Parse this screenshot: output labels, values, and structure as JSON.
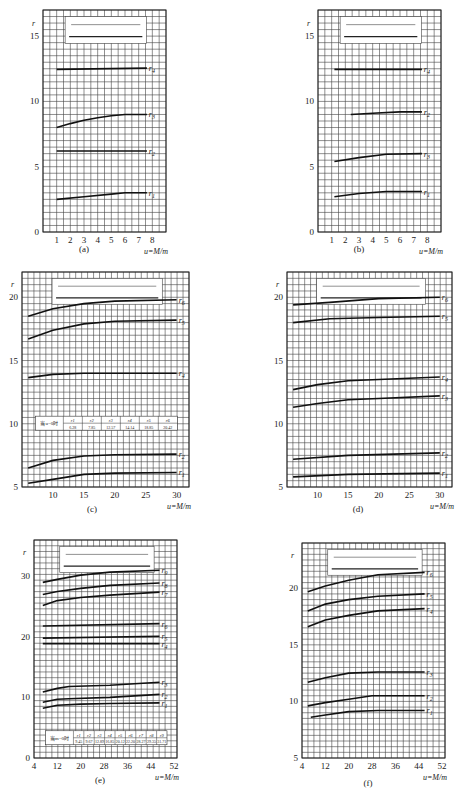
{
  "figure": {
    "y_axis_symbol": "r",
    "x_axis_label": "u = M/m",
    "panels": [
      {
        "id": "a",
        "caption": "(a)",
        "inset": "simple span l, mass m at l/2"
      },
      {
        "id": "b",
        "caption": "(b)",
        "inset": "simple span l, mass m at l/4"
      },
      {
        "id": "c",
        "caption": "(c)",
        "inset": "two spans l, masses m at l/2",
        "table_label": "当u=0时",
        "table": [
          {
            "k": "r1",
            "v": "6.28"
          },
          {
            "k": "r2",
            "v": "7.85"
          },
          {
            "k": "r3",
            "v": "12.57"
          },
          {
            "k": "r4",
            "v": "14.14"
          },
          {
            "k": "r5",
            "v": "18.85"
          },
          {
            "k": "r6",
            "v": "20.42"
          }
        ]
      },
      {
        "id": "d",
        "caption": "(d)",
        "inset": "two spans l, masses m at l/4"
      },
      {
        "id": "e",
        "caption": "(e)",
        "inset": "three spans l, masses m at l/2",
        "table_label": "当m=0时",
        "table": [
          {
            "k": "r1",
            "v": "9.45"
          },
          {
            "k": "r2",
            "v": "9.67"
          },
          {
            "k": "r3",
            "v": "12.89"
          },
          {
            "k": "r4",
            "v": "16.85"
          },
          {
            "k": "r5",
            "v": "20.12"
          },
          {
            "k": "r6",
            "v": "22.20"
          },
          {
            "k": "r7",
            "v": "28.27"
          },
          {
            "k": "r8",
            "v": "29.35"
          },
          {
            "k": "r9",
            "v": "31.71"
          }
        ]
      },
      {
        "id": "f",
        "caption": "(f)",
        "inset": "three spans l, masses m at l/4"
      }
    ]
  },
  "chart_data": [
    {
      "id": "a",
      "type": "line",
      "title": "(a)",
      "xlabel": "u=M/m",
      "ylabel": "r",
      "xlim": [
        0,
        9
      ],
      "ylim": [
        0,
        17
      ],
      "xticks": [
        1,
        2,
        3,
        4,
        5,
        6,
        7,
        8
      ],
      "yticks": [
        0,
        5,
        10,
        15
      ],
      "grid": true,
      "series": [
        {
          "name": "r1",
          "x": [
            1,
            3,
            5,
            6,
            7.6
          ],
          "y": [
            2.5,
            2.7,
            2.9,
            3.0,
            3.0
          ]
        },
        {
          "name": "r2",
          "x": [
            1,
            7.6
          ],
          "y": [
            6.2,
            6.2
          ]
        },
        {
          "name": "r3",
          "x": [
            1,
            2,
            3,
            4,
            5,
            6,
            7.6
          ],
          "y": [
            8.0,
            8.3,
            8.55,
            8.75,
            8.9,
            9.0,
            9.0
          ]
        },
        {
          "name": "r4",
          "x": [
            1,
            7.6
          ],
          "y": [
            12.45,
            12.55
          ]
        }
      ]
    },
    {
      "id": "b",
      "type": "line",
      "title": "(b)",
      "xlabel": "u=M/m",
      "ylabel": "r",
      "xlim": [
        0,
        9
      ],
      "ylim": [
        0,
        17
      ],
      "xticks": [
        1,
        2,
        3,
        4,
        5,
        6,
        7,
        8
      ],
      "yticks": [
        0,
        5,
        10,
        15
      ],
      "grid": true,
      "series": [
        {
          "name": "r1",
          "x": [
            1.2,
            3,
            5,
            7.6
          ],
          "y": [
            2.7,
            2.95,
            3.1,
            3.1
          ]
        },
        {
          "name": "r2",
          "x": [
            2.4,
            4,
            6,
            7.6
          ],
          "y": [
            9.0,
            9.1,
            9.2,
            9.2
          ]
        },
        {
          "name": "r3",
          "x": [
            1.2,
            3,
            5,
            7.6
          ],
          "y": [
            5.4,
            5.7,
            5.95,
            6.0
          ]
        },
        {
          "name": "r4",
          "x": [
            1.2,
            7.6
          ],
          "y": [
            12.45,
            12.45
          ]
        }
      ]
    },
    {
      "id": "c",
      "type": "line",
      "title": "(c)",
      "xlabel": "u=M/m",
      "ylabel": "r",
      "xlim": [
        5,
        32
      ],
      "ylim": [
        5,
        22
      ],
      "xticks": [
        10,
        15,
        20,
        25,
        30
      ],
      "yticks": [
        5,
        10,
        15,
        20
      ],
      "grid": true,
      "series": [
        {
          "name": "r1",
          "x": [
            6,
            10,
            15,
            20,
            30
          ],
          "y": [
            5.3,
            5.6,
            6.0,
            6.1,
            6.15
          ]
        },
        {
          "name": "r2",
          "x": [
            6,
            10,
            15,
            20,
            30
          ],
          "y": [
            6.5,
            7.1,
            7.45,
            7.55,
            7.6
          ]
        },
        {
          "name": "r4",
          "x": [
            6,
            10,
            15,
            30
          ],
          "y": [
            13.65,
            13.9,
            14.0,
            14.0
          ]
        },
        {
          "name": "r5",
          "x": [
            6,
            10,
            15,
            20,
            30
          ],
          "y": [
            16.7,
            17.4,
            17.9,
            18.1,
            18.2
          ]
        },
        {
          "name": "r6",
          "x": [
            6,
            10,
            15,
            20,
            30
          ],
          "y": [
            18.5,
            19.1,
            19.5,
            19.7,
            19.8
          ]
        }
      ]
    },
    {
      "id": "d",
      "type": "line",
      "title": "(d)",
      "xlabel": "u=M/m",
      "ylabel": "r",
      "xlim": [
        5,
        32
      ],
      "ylim": [
        5,
        22
      ],
      "xticks": [
        10,
        15,
        20,
        25,
        30
      ],
      "yticks": [
        5,
        10,
        15,
        20
      ],
      "grid": true,
      "series": [
        {
          "name": "r1",
          "x": [
            6,
            15,
            30
          ],
          "y": [
            5.8,
            6.0,
            6.1
          ]
        },
        {
          "name": "r2",
          "x": [
            6,
            15,
            30
          ],
          "y": [
            7.2,
            7.5,
            7.7
          ]
        },
        {
          "name": "r3",
          "x": [
            6,
            10,
            15,
            20,
            30
          ],
          "y": [
            11.3,
            11.6,
            11.9,
            12.0,
            12.2
          ]
        },
        {
          "name": "r4",
          "x": [
            6,
            10,
            15,
            20,
            30
          ],
          "y": [
            12.7,
            13.1,
            13.4,
            13.5,
            13.7
          ]
        },
        {
          "name": "r5",
          "x": [
            6,
            12,
            20,
            30
          ],
          "y": [
            18.0,
            18.3,
            18.4,
            18.5
          ]
        },
        {
          "name": "r6",
          "x": [
            6,
            12,
            20,
            30
          ],
          "y": [
            19.4,
            19.6,
            19.9,
            20.0
          ]
        }
      ]
    },
    {
      "id": "e",
      "type": "line",
      "title": "(e)",
      "xlabel": "u=M/m",
      "ylabel": "r",
      "xlim": [
        4,
        53
      ],
      "ylim": [
        0,
        36
      ],
      "xticks": [
        4,
        12,
        20,
        28,
        36,
        44,
        52
      ],
      "yticks": [
        0,
        10,
        20,
        30
      ],
      "grid": true,
      "series": [
        {
          "name": "r1",
          "x": [
            7,
            12,
            20,
            30,
            47
          ],
          "y": [
            8.2,
            8.7,
            8.9,
            9.0,
            9.1
          ]
        },
        {
          "name": "r2",
          "x": [
            7,
            12,
            16,
            30,
            47
          ],
          "y": [
            9.2,
            9.7,
            9.8,
            10.0,
            10.5
          ]
        },
        {
          "name": "r3",
          "x": [
            7,
            12,
            16,
            30,
            47
          ],
          "y": [
            10.9,
            11.5,
            11.8,
            12.0,
            12.5
          ]
        },
        {
          "name": "r4",
          "x": [
            7,
            47
          ],
          "y": [
            18.9,
            18.9
          ]
        },
        {
          "name": "r5",
          "x": [
            7,
            47
          ],
          "y": [
            19.8,
            20.1
          ]
        },
        {
          "name": "r6",
          "x": [
            7,
            47
          ],
          "y": [
            21.8,
            22.2
          ]
        },
        {
          "name": "r7",
          "x": [
            7,
            12,
            20,
            30,
            47
          ],
          "y": [
            25.2,
            26.0,
            26.5,
            26.9,
            27.4
          ]
        },
        {
          "name": "r8",
          "x": [
            7,
            12,
            20,
            30,
            47
          ],
          "y": [
            27.0,
            27.5,
            28.0,
            28.5,
            28.9
          ]
        },
        {
          "name": "r9",
          "x": [
            7,
            12,
            20,
            30,
            47
          ],
          "y": [
            29.0,
            29.5,
            30.2,
            30.7,
            31.0
          ]
        }
      ]
    },
    {
      "id": "f",
      "type": "line",
      "title": "(f)",
      "xlabel": "u=M/m",
      "ylabel": "r",
      "xlim": [
        4,
        53
      ],
      "ylim": [
        5,
        24
      ],
      "xticks": [
        4,
        12,
        20,
        28,
        36,
        44,
        52
      ],
      "yticks": [
        5,
        10,
        15,
        20
      ],
      "grid": true,
      "series": [
        {
          "name": "r1",
          "x": [
            7,
            12,
            20,
            30,
            46
          ],
          "y": [
            8.6,
            8.8,
            9.1,
            9.2,
            9.2
          ]
        },
        {
          "name": "r2",
          "x": [
            6,
            12,
            20,
            28,
            46
          ],
          "y": [
            9.6,
            9.9,
            10.2,
            10.5,
            10.5
          ]
        },
        {
          "name": "r3",
          "x": [
            6,
            12,
            20,
            30,
            46
          ],
          "y": [
            11.7,
            12.1,
            12.5,
            12.6,
            12.6
          ]
        },
        {
          "name": "r4",
          "x": [
            6,
            12,
            20,
            30,
            46
          ],
          "y": [
            16.6,
            17.2,
            17.6,
            18.0,
            18.2
          ]
        },
        {
          "name": "r5",
          "x": [
            6,
            12,
            20,
            30,
            46
          ],
          "y": [
            18.0,
            18.6,
            19.0,
            19.3,
            19.5
          ]
        },
        {
          "name": "r6",
          "x": [
            6,
            12,
            20,
            30,
            46
          ],
          "y": [
            19.7,
            20.2,
            20.7,
            21.2,
            21.4
          ]
        }
      ]
    }
  ]
}
